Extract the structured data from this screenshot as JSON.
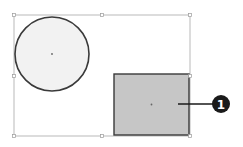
{
  "diagram": {
    "selection_box": {
      "x": 14,
      "y": 15,
      "width": 176,
      "height": 121,
      "stroke": "#a8a8a8"
    },
    "handles": [
      {
        "x": 14,
        "y": 15
      },
      {
        "x": 102,
        "y": 15
      },
      {
        "x": 190,
        "y": 15
      },
      {
        "x": 14,
        "y": 76
      },
      {
        "x": 190,
        "y": 76
      },
      {
        "x": 14,
        "y": 136
      },
      {
        "x": 102,
        "y": 136
      },
      {
        "x": 190,
        "y": 136
      }
    ],
    "circle": {
      "cx": 52,
      "cy": 54,
      "r": 37,
      "fill": "#f2f2f2",
      "stroke": "#3a3a3a"
    },
    "rectangle": {
      "x": 114,
      "y": 74,
      "width": 75,
      "height": 61,
      "fill": "#c6c6c6",
      "stroke": "#3a3a3a"
    },
    "callout": {
      "label": "1",
      "line_x1": 178,
      "line_x2": 213,
      "y": 104,
      "badge_cx": 221,
      "badge_cy": 104,
      "badge_r": 9,
      "color": "#1a1a1a"
    }
  }
}
